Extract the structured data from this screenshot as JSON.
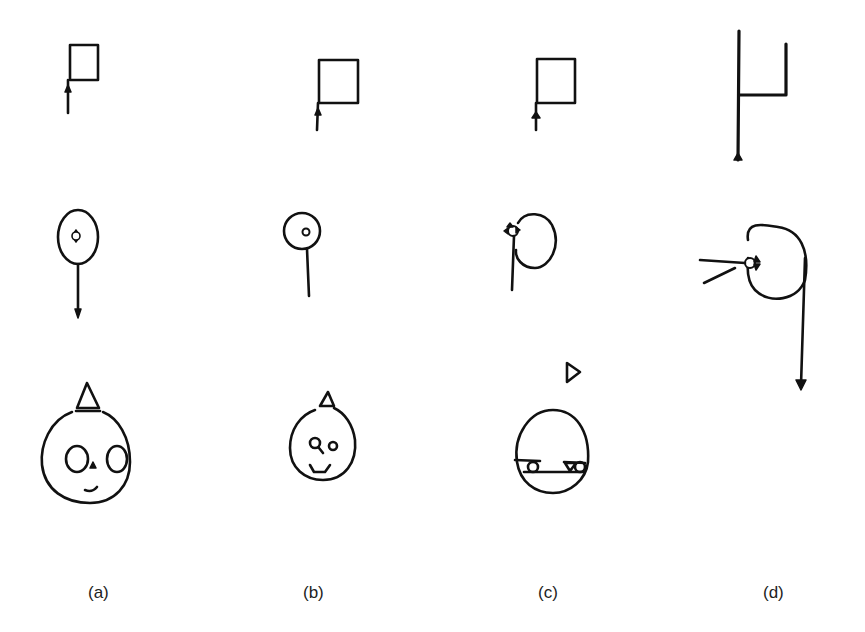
{
  "figure": {
    "columns": [
      {
        "id": "a",
        "label": "(a)",
        "label_x": 88
      },
      {
        "id": "b",
        "label": "(b)",
        "label_x": 303
      },
      {
        "id": "c",
        "label": "(c)",
        "label_x": 538
      },
      {
        "id": "d",
        "label": "(d)",
        "label_x": 763
      }
    ],
    "rows": [
      "flag",
      "balloon-with-star",
      "face"
    ],
    "colors": {
      "ink": "#111111",
      "background": "#ffffff"
    }
  }
}
